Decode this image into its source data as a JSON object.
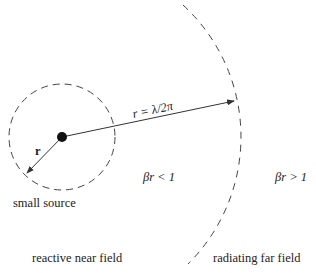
{
  "diagram": {
    "type": "near-field / far-field regions of a small source",
    "colors": {
      "line": "#333333",
      "dash": "#444444",
      "background": "#ffffff"
    },
    "source": {
      "label": "small source",
      "center": [
        62,
        137
      ],
      "dot_radius": 5
    },
    "inner_circle": {
      "center": [
        62,
        137
      ],
      "radius": 53,
      "style": "dashed"
    },
    "outer_boundary": {
      "center": [
        62,
        137
      ],
      "radius": 179,
      "style": "dashed arc"
    },
    "arrows": [
      {
        "name": "small-radius",
        "label": "r",
        "from": [
          62,
          137
        ],
        "to": [
          27,
          173
        ]
      },
      {
        "name": "boundary-radius",
        "label": "r = λ/2π",
        "from": [
          62,
          137
        ],
        "to": [
          234,
          101
        ]
      }
    ],
    "labels": {
      "r_small": "r",
      "r_boundary": "r = λ/2π",
      "inner_condition": "βr < 1",
      "outer_condition": "βr > 1",
      "small_source": "small source",
      "near_field": "reactive near field",
      "far_field": "radiating far field"
    }
  }
}
